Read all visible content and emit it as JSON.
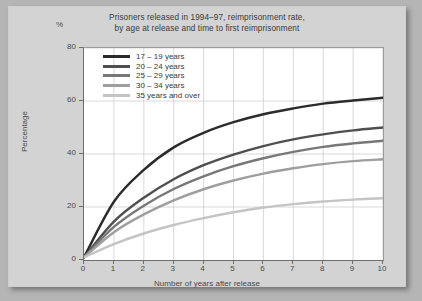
{
  "title_line1": "Prisoners released in 1994–97, reimprisonment rate,",
  "title_line2": "by age at release and time to first reimprisonment",
  "percent_symbol": "%",
  "ylabel": "Percentage",
  "xlabel": "Number of years after release",
  "yticks": [
    "0",
    "20",
    "40",
    "60",
    "80"
  ],
  "xticks": [
    "0",
    "1",
    "2",
    "3",
    "4",
    "5",
    "6",
    "7",
    "8",
    "9",
    "10"
  ],
  "legend": [
    {
      "label": "17 – 19 years",
      "color": "#2b2b2b"
    },
    {
      "label": "20 – 24 years",
      "color": "#4f4f4f"
    },
    {
      "label": "25 – 29 years",
      "color": "#777777"
    },
    {
      "label": "30 – 34 years",
      "color": "#9e9e9e"
    },
    {
      "label": "35 years and over",
      "color": "#c4c4c4"
    }
  ],
  "chart_data": {
    "type": "line",
    "title": "Prisoners released in 1994–97, reimprisonment rate, by age at release and time to first reimprisonment",
    "xlabel": "Number of years after release",
    "ylabel": "Percentage",
    "yunit": "%",
    "xlim": [
      0,
      10
    ],
    "ylim": [
      0,
      80
    ],
    "xticks": [
      0,
      1,
      2,
      3,
      4,
      5,
      6,
      7,
      8,
      9,
      10
    ],
    "yticks": [
      0,
      20,
      40,
      60,
      80
    ],
    "grid": true,
    "legend_position": "top-left inside plot",
    "x": [
      0,
      1,
      2,
      3,
      4,
      5,
      6,
      7,
      8,
      9,
      10
    ],
    "series": [
      {
        "name": "17 – 19 years",
        "color": "#2b2b2b",
        "values": [
          1.0,
          22.0,
          34.0,
          42.5,
          48.0,
          52.0,
          55.0,
          57.2,
          59.0,
          60.2,
          61.2
        ]
      },
      {
        "name": "20 – 24 years",
        "color": "#4f4f4f",
        "values": [
          1.0,
          14.5,
          23.5,
          30.5,
          35.8,
          39.8,
          43.0,
          45.5,
          47.4,
          48.9,
          50.0
        ]
      },
      {
        "name": "25 – 29 years",
        "color": "#777777",
        "values": [
          1.0,
          12.5,
          20.5,
          26.8,
          31.6,
          35.4,
          38.4,
          40.8,
          42.7,
          44.0,
          45.0
        ]
      },
      {
        "name": "30 – 34 years",
        "color": "#9e9e9e",
        "values": [
          1.0,
          10.5,
          17.2,
          22.5,
          26.7,
          30.0,
          32.6,
          34.6,
          36.2,
          37.3,
          38.0
        ]
      },
      {
        "name": "35 years and over",
        "color": "#c4c4c4",
        "values": [
          1.0,
          6.0,
          10.0,
          13.2,
          15.8,
          18.0,
          19.8,
          21.1,
          22.1,
          22.8,
          23.3
        ]
      }
    ]
  }
}
